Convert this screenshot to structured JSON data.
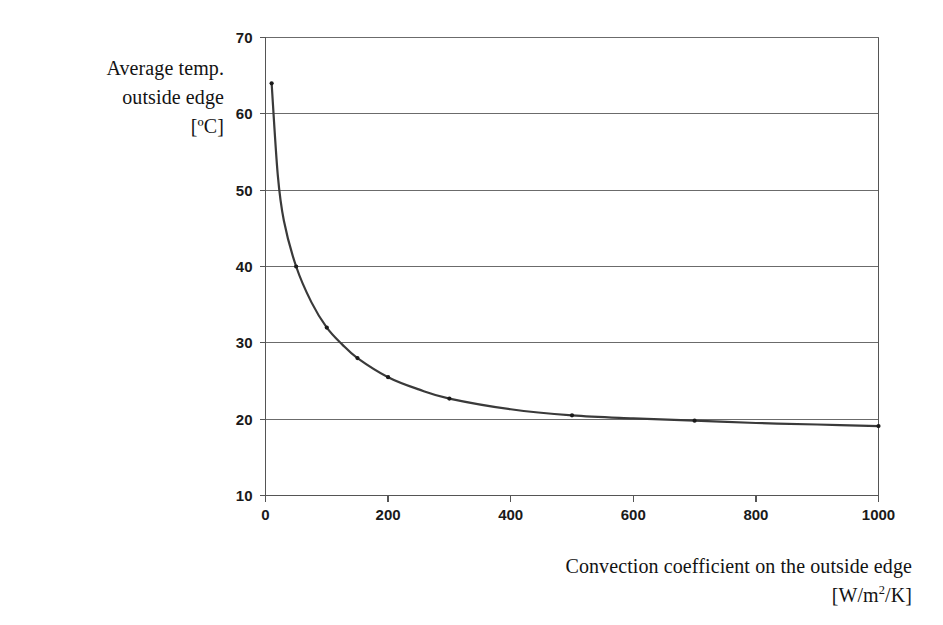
{
  "figure": {
    "background_color": "#ffffff",
    "axis_color": "#555555",
    "grid_color": "#6b6b6b",
    "curve_color": "#3a3a3a",
    "marker_color": "#1a1a1a"
  },
  "y_axis_title": {
    "line1": "Average temp.",
    "line2": "outside edge",
    "line3": "[ºC]"
  },
  "x_axis_title": {
    "line1": "Convection coefficient on the outside edge",
    "line2_prefix": "[W/m",
    "line2_sup": "2",
    "line2_suffix": "/K]"
  },
  "chart_data": {
    "type": "line",
    "title": "",
    "subtitle": "",
    "xlabel": "Convection coefficient on the outside edge [W/m2/K]",
    "ylabel": "Average temp. outside edge [ºC]",
    "xlim": [
      0,
      1000
    ],
    "ylim": [
      10,
      70
    ],
    "xticks": [
      0,
      200,
      400,
      600,
      800,
      1000
    ],
    "yticks": [
      10,
      20,
      30,
      40,
      50,
      60,
      70
    ],
    "xtick_labels": [
      "0",
      "200",
      "400",
      "600",
      "800",
      "1000"
    ],
    "ytick_labels": [
      "10",
      "20",
      "30",
      "40",
      "50",
      "60",
      "70"
    ],
    "grid": "horizontal",
    "grid_x": false,
    "grid_y": true,
    "legend": "none",
    "legend_position": "none",
    "annotations": [],
    "series": [
      {
        "name": "Average temp. outside edge",
        "marker": "small-dot",
        "line_width": 2.2,
        "x": [
          10,
          20,
          30,
          50,
          75,
          100,
          125,
          150,
          200,
          250,
          300,
          400,
          500,
          600,
          700,
          800,
          900,
          1000
        ],
        "y": [
          64.0,
          52.0,
          46.0,
          40.0,
          35.3,
          32.0,
          29.8,
          28.0,
          25.5,
          23.9,
          22.7,
          21.3,
          20.5,
          20.1,
          19.8,
          19.5,
          19.3,
          19.1
        ],
        "marker_x": [
          10,
          50,
          100,
          150,
          200,
          300,
          500,
          700,
          1000
        ],
        "marker_y": [
          64.0,
          40.0,
          32.0,
          28.0,
          25.5,
          22.7,
          20.5,
          19.8,
          19.1
        ]
      }
    ]
  }
}
